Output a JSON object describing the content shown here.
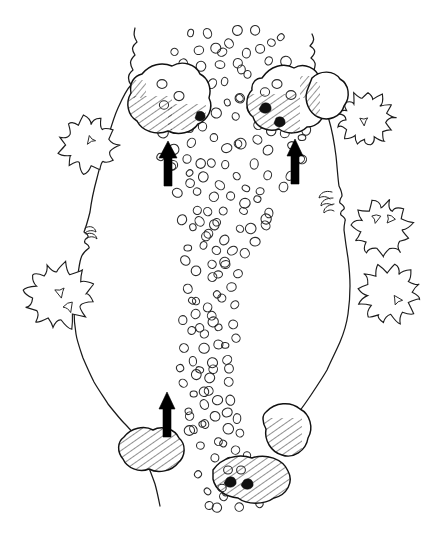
{
  "figure": {
    "medium": "pen-and-ink line drawing",
    "background_color": "#ffffff",
    "ink_color": "#1a1a1a",
    "width_px": 432,
    "height_px": 536
  },
  "legend_semantics": {
    "flow_arrow": "solid black arrow indicating flow direction (upstream-pointing)",
    "boulder": "closed irregular outline with diagonal hatch shading",
    "cobble_field": "field of small open ellipses representing cobbles / gravel bar",
    "shrub": "scalloped lobed outline representing shrub or bush canopy",
    "bankline": "wavering line representing the channel bank / valley margin"
  },
  "features": {
    "banklines": [
      {
        "name": "left-bankline",
        "label": "left bank",
        "path": "M135,28 L133,36 L137,42 L131,48 L135,55 L130,62 L133,70 L128,77 L131,85 L125,94 L118,108 L112,124 L107,141 L102,159 L97,178 L93,196 L90,212 L86,226 L84,232 L88,236 L84,241 L89,246 L84,250 L81,258 L79,268 L77,282 L75,296 L74,310 L74,322 L76,334 L79,346 L83,358 L88,370 L94,382 L101,394 L108,404 L116,414 L124,423 L131,430 L137,437"
      },
      {
        "name": "right-bankline",
        "label": "right bank",
        "path": "M312,34 L315,41 L310,46 L316,52 L311,58 L316,64 L313,72 L316,80 L319,90 L324,104 L329,120 L333,138 L336,156 L338,172 L339,186 L342,196 L340,203 L344,209 L341,215 L345,221 L344,230 L346,244 L348,258 L349,272 L350,286 L350,300 L348,314 L345,328 L340,342 L334,356 L327,370 L319,383 L311,395 L303,406 L296,416 L290,425"
      },
      {
        "name": "left-bankline-lower-tail",
        "label": "lower left bank tail",
        "path": "M137,437 L141,448 L146,460 L151,472 L155,484 L158,496 L160,506"
      }
    ],
    "cobble_field": {
      "name": "cobble-gravel-bar",
      "label": "cobble / gravel bar",
      "count": 198,
      "symbol": "small open ellipse"
    },
    "boulders": [
      {
        "name": "boulder-upper-left",
        "label": "upper left boulder cluster",
        "cx": 168,
        "cy": 108,
        "hatched": true
      },
      {
        "name": "boulder-upper-right",
        "label": "upper right boulder cluster",
        "cx": 288,
        "cy": 105,
        "hatched": true
      },
      {
        "name": "boulder-upper-right-outer",
        "label": "upper right outer boulder",
        "cx": 322,
        "cy": 102,
        "hatched": true
      },
      {
        "name": "boulder-lower-left",
        "label": "lower left boulder",
        "cx": 150,
        "cy": 451,
        "hatched": true
      },
      {
        "name": "boulder-lower-right",
        "label": "lower right boulder",
        "cx": 287,
        "cy": 440,
        "hatched": true
      },
      {
        "name": "boulder-bottom-center",
        "label": "bottom centre boulder",
        "cx": 255,
        "cy": 479,
        "hatched": true
      }
    ],
    "shrubs": [
      {
        "name": "shrub-left-upper",
        "label": "left upper shrub",
        "cx": 88,
        "cy": 145,
        "r": 30
      },
      {
        "name": "shrub-left-lower",
        "label": "left lower shrub",
        "cx": 59,
        "cy": 296,
        "r": 35
      },
      {
        "name": "shrub-right-upper",
        "label": "right upper shrub",
        "cx": 366,
        "cy": 119,
        "r": 29
      },
      {
        "name": "shrub-right-middle",
        "label": "right middle shrub",
        "cx": 382,
        "cy": 228,
        "r": 30
      },
      {
        "name": "shrub-right-lower",
        "label": "right lower shrub",
        "cx": 389,
        "cy": 294,
        "r": 32
      }
    ],
    "flow_arrows": [
      {
        "name": "flow-arrow-left",
        "label": "flow direction arrow (left)",
        "x": 168,
        "y": 165,
        "direction": "up"
      },
      {
        "name": "flow-arrow-right",
        "label": "flow direction arrow (right)",
        "x": 295,
        "y": 163,
        "direction": "up"
      },
      {
        "name": "flow-arrow-lower",
        "label": "flow direction arrow (lower)",
        "x": 167,
        "y": 414,
        "direction": "up"
      }
    ],
    "vegetation_tufts": [
      {
        "name": "bank-tuft-right",
        "label": "bank vegetation tuft (right)",
        "x": 330,
        "y": 196
      },
      {
        "name": "bank-tuft-left",
        "label": "bank vegetation tuft (left)",
        "x": 88,
        "y": 232
      }
    ]
  }
}
